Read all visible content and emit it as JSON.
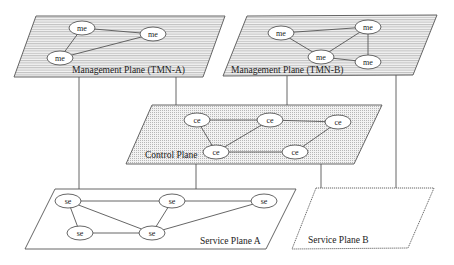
{
  "diagram": {
    "title": "",
    "planes": [
      {
        "id": "mgmt-a",
        "label": "Management Plane (TMN-A)",
        "style": "horizontal-lines",
        "corners": [
          [
            36,
            16
          ],
          [
            225,
            16
          ],
          [
            203,
            77
          ],
          [
            14,
            77
          ]
        ],
        "label_pos": [
          72,
          73
        ],
        "node_prefix": "me",
        "nodes": [
          {
            "label": "me",
            "x": 82,
            "y": 28
          },
          {
            "label": "me",
            "x": 153,
            "y": 34
          },
          {
            "label": "me",
            "x": 60,
            "y": 58
          }
        ],
        "edges": [
          [
            0,
            1
          ],
          [
            0,
            2
          ],
          [
            1,
            2
          ]
        ]
      },
      {
        "id": "mgmt-b",
        "label": "Management Plane (TMN-B)",
        "style": "horizontal-lines",
        "corners": [
          [
            247,
            16
          ],
          [
            437,
            15
          ],
          [
            413,
            75
          ],
          [
            223,
            76
          ]
        ],
        "label_pos": [
          231,
          73
        ],
        "node_prefix": "me",
        "nodes": [
          {
            "label": "me",
            "x": 281,
            "y": 33
          },
          {
            "label": "me",
            "x": 368,
            "y": 27
          },
          {
            "label": "me",
            "x": 321,
            "y": 57
          },
          {
            "label": "me",
            "x": 368,
            "y": 62
          }
        ],
        "edges": [
          [
            0,
            1
          ],
          [
            0,
            2
          ],
          [
            1,
            2
          ],
          [
            1,
            3
          ],
          [
            2,
            3
          ]
        ]
      },
      {
        "id": "control",
        "label": "Control Plane",
        "style": "dotted",
        "corners": [
          [
            152,
            105
          ],
          [
            382,
            105
          ],
          [
            354,
            164
          ],
          [
            126,
            164
          ]
        ],
        "label_pos": [
          145,
          158
        ],
        "node_prefix": "ce",
        "nodes": [
          {
            "label": "ce",
            "x": 197,
            "y": 120
          },
          {
            "label": "ce",
            "x": 270,
            "y": 120
          },
          {
            "label": "ce",
            "x": 338,
            "y": 122
          },
          {
            "label": "ce",
            "x": 216,
            "y": 152
          },
          {
            "label": "ce",
            "x": 295,
            "y": 152
          }
        ],
        "edges": [
          [
            0,
            1
          ],
          [
            1,
            2
          ],
          [
            0,
            3
          ],
          [
            1,
            3
          ],
          [
            3,
            4
          ],
          [
            2,
            4
          ]
        ]
      },
      {
        "id": "service-a",
        "label": "Service Plane A",
        "style": "solid-white",
        "corners": [
          [
            55,
            189
          ],
          [
            296,
            189
          ],
          [
            266,
            249
          ],
          [
            25,
            249
          ]
        ],
        "label_pos": [
          200,
          244
        ],
        "node_prefix": "se",
        "nodes": [
          {
            "label": "se",
            "x": 68,
            "y": 201
          },
          {
            "label": "se",
            "x": 172,
            "y": 201
          },
          {
            "label": "se",
            "x": 264,
            "y": 201
          },
          {
            "label": "se",
            "x": 80,
            "y": 233
          },
          {
            "label": "se",
            "x": 152,
            "y": 233
          }
        ],
        "edges": [
          [
            0,
            1
          ],
          [
            1,
            2
          ],
          [
            0,
            3
          ],
          [
            0,
            4
          ],
          [
            1,
            4
          ],
          [
            3,
            4
          ],
          [
            2,
            4
          ]
        ]
      },
      {
        "id": "service-b",
        "label": "Service Plane B",
        "style": "dashed-white",
        "corners": [
          [
            316,
            188
          ],
          [
            434,
            188
          ],
          [
            408,
            248
          ],
          [
            292,
            249
          ]
        ],
        "label_pos": [
          308,
          243
        ],
        "node_prefix": "se",
        "nodes": [],
        "edges": []
      }
    ],
    "connectors": [
      {
        "from": "mgmt-a",
        "to": "service-a",
        "x1": 79,
        "y1": 77,
        "x2": 79,
        "y2": 189
      },
      {
        "from": "mgmt-a",
        "to": "control",
        "x1": 176,
        "y1": 77,
        "x2": 176,
        "y2": 105
      },
      {
        "from": "mgmt-b",
        "to": "control",
        "x1": 287,
        "y1": 76,
        "x2": 287,
        "y2": 105
      },
      {
        "from": "mgmt-b",
        "to": "service-b",
        "x1": 396,
        "y1": 75,
        "x2": 396,
        "y2": 188
      },
      {
        "from": "control",
        "to": "service-a",
        "x1": 196,
        "y1": 164,
        "x2": 196,
        "y2": 189
      },
      {
        "from": "control",
        "to": "service-b",
        "x1": 321,
        "y1": 164,
        "x2": 321,
        "y2": 188
      }
    ],
    "colors": {
      "plane_fill_lines": "#e8e8e8",
      "plane_line_stroke": "#9a9a9a",
      "plane_border": "#555555",
      "dotted_fill": "#ececec",
      "node_fill": "#ffffff",
      "text": "#222222"
    }
  }
}
